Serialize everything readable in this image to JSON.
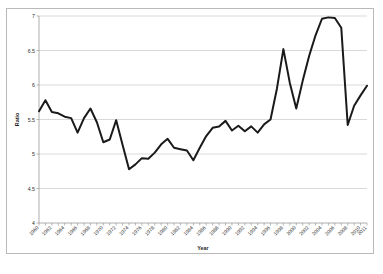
{
  "chart_data": {
    "type": "line",
    "title": "",
    "xlabel": "Year",
    "ylabel": "Ratio",
    "ylim": [
      4,
      7
    ],
    "xlim": [
      1960,
      2011
    ],
    "grid": true,
    "legend": false,
    "ytick_labels": [
      "7",
      "6.5",
      "6",
      "5.5",
      "5",
      "4.5",
      "4"
    ],
    "ytick_values": [
      7,
      6.5,
      6,
      5.5,
      5,
      4.5,
      4
    ],
    "xtick_labels": [
      "1960",
      "1962",
      "1964",
      "1966",
      "1968",
      "1970",
      "1972",
      "1974",
      "1976",
      "1978",
      "1980",
      "1982",
      "1984",
      "1986",
      "1988",
      "1990",
      "1992",
      "1994",
      "1996",
      "1998",
      "2000",
      "2002",
      "2004",
      "2006",
      "2008",
      "2010",
      "2011"
    ],
    "xtick_label_rotation": 45,
    "line_color": "#1a1a1a",
    "series": [
      {
        "name": "Ratio",
        "x": [
          1960,
          1961,
          1962,
          1963,
          1964,
          1965,
          1966,
          1967,
          1968,
          1969,
          1970,
          1971,
          1972,
          1973,
          1974,
          1975,
          1976,
          1977,
          1978,
          1979,
          1980,
          1981,
          1982,
          1983,
          1984,
          1985,
          1986,
          1987,
          1988,
          1989,
          1990,
          1991,
          1992,
          1993,
          1994,
          1995,
          1996,
          1997,
          1998,
          1999,
          2000,
          2001,
          2002,
          2003,
          2004,
          2005,
          2006,
          2007,
          2008,
          2009,
          2010,
          2011
        ],
        "values": [
          5.62,
          5.78,
          5.61,
          5.59,
          5.54,
          5.52,
          5.31,
          5.52,
          5.66,
          5.46,
          5.17,
          5.21,
          5.49,
          5.13,
          4.78,
          4.85,
          4.94,
          4.93,
          5.02,
          5.14,
          5.22,
          5.09,
          5.07,
          5.05,
          4.91,
          5.09,
          5.26,
          5.38,
          5.4,
          5.48,
          5.34,
          5.41,
          5.33,
          5.4,
          5.31,
          5.43,
          5.5,
          5.95,
          6.52,
          6.03,
          5.66,
          6.06,
          6.42,
          6.72,
          6.96,
          6.98,
          6.97,
          6.83,
          5.42,
          5.7,
          5.85,
          5.99
        ]
      }
    ]
  },
  "axis_titles": {
    "x": "Year",
    "y": "Ratio"
  },
  "caption": {
    "text": ""
  }
}
